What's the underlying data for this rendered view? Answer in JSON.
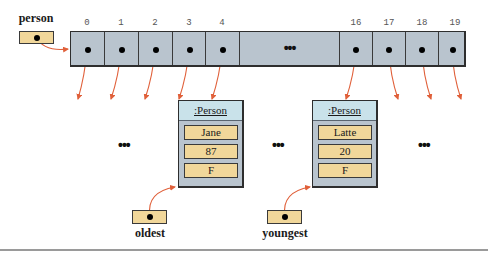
{
  "diagram": {
    "type": "object-reference-array",
    "colors": {
      "reference_box": "#f1d79a",
      "array_fill": "#b9c4ce",
      "object_header": "#c9e2ea",
      "arrow": "#e0603a",
      "border": "#2e2e2e"
    },
    "array_variable": {
      "label": "person"
    },
    "array": {
      "indices_left": [
        "0",
        "1",
        "2",
        "3",
        "4"
      ],
      "middle_ellipsis": "•••",
      "indices_right": [
        "16",
        "17",
        "18",
        "19"
      ]
    },
    "ellipses": {
      "left": "•••",
      "middle": "•••",
      "right": "•••"
    },
    "objects": [
      {
        "class_label": ":Person",
        "fields": [
          "Jane",
          "87",
          "F"
        ],
        "referenced_by_index": "4"
      },
      {
        "class_label": ":Person",
        "fields": [
          "Latte",
          "20",
          "F"
        ],
        "referenced_by_index": "16"
      }
    ],
    "reference_variables": [
      {
        "label": "oldest",
        "points_to": 0
      },
      {
        "label": "youngest",
        "points_to": 1
      }
    ]
  }
}
